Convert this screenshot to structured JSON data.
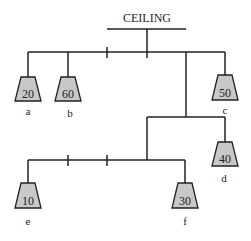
{
  "title": "CEILING",
  "weights": [
    {
      "id": "a",
      "label": "a",
      "value": "20",
      "cx": 28,
      "top": 77
    },
    {
      "id": "b",
      "label": "b",
      "value": "60",
      "cx": 68,
      "top": 77
    },
    {
      "id": "c",
      "label": "c",
      "value": "50",
      "cx": 225,
      "top": 75
    },
    {
      "id": "d",
      "label": "d",
      "value": "40",
      "cx": 225,
      "top": 142
    },
    {
      "id": "e",
      "label": "e",
      "value": "10",
      "cx": 28,
      "top": 183
    },
    {
      "id": "f",
      "label": "f",
      "value": "30",
      "cx": 185,
      "top": 183
    }
  ],
  "colors": {
    "line": "#222222",
    "weight_fill": "#c8c8c8"
  }
}
